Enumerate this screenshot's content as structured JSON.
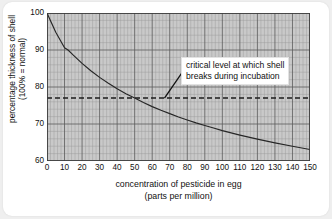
{
  "chart_data": {
    "type": "line",
    "title": "",
    "xlabel": "concentration of pesticide in egg",
    "xlabel_sub": "(parts per million)",
    "ylabel": "percentage thickness of shell",
    "ylabel_sub": "(100% = normal)",
    "xlim": [
      0,
      150
    ],
    "ylim": [
      60,
      100
    ],
    "xticks": [
      0,
      10,
      20,
      30,
      40,
      50,
      60,
      70,
      80,
      90,
      100,
      110,
      120,
      130,
      140,
      150
    ],
    "yticks": [
      60,
      70,
      80,
      90,
      100
    ],
    "grid": true,
    "grid_major_x": 10,
    "grid_minor_x": 2,
    "grid_major_y": 10,
    "grid_minor_y": 2,
    "legend": "none",
    "series": [
      {
        "name": "percentage thickness of shell",
        "x": [
          0,
          5,
          10,
          12,
          15,
          20,
          25,
          30,
          35,
          40,
          45,
          50,
          55,
          60,
          65,
          70,
          75,
          80,
          85,
          90,
          95,
          100,
          110,
          120,
          130,
          140,
          150
        ],
        "values": [
          100.0,
          94.8,
          90.6,
          90.0,
          88.6,
          86.4,
          84.4,
          82.6,
          81.0,
          79.5,
          78.2,
          77.0,
          75.8,
          74.7,
          73.7,
          72.8,
          71.9,
          71.1,
          70.3,
          69.6,
          68.9,
          68.2,
          67.0,
          65.9,
          64.9,
          64.0,
          63.1
        ]
      }
    ],
    "reference_lines": [
      {
        "name": "critical-level",
        "orientation": "horizontal",
        "value": 77,
        "style": "dashed"
      }
    ],
    "annotations": [
      {
        "name": "critical-level-annotation",
        "line1": "critical level at which shell",
        "line2": "breaks during incubation",
        "pointer_to_x": 67,
        "pointer_to_y": 77
      }
    ],
    "colors": {
      "plot_background": "#c9c9c9",
      "grid_major": "#5a5a5a",
      "grid_minor": "#9a9a9a",
      "curve": "#262626",
      "reference_line": "#1c1c1c",
      "page_background": "#efefef",
      "card_background": "#ffffff",
      "text": "#111111"
    }
  },
  "axis": {
    "y_title_line1": "percentage thickness of shell",
    "y_title_line2": "(100% = normal)",
    "x_title_line1": "concentration of pesticide in egg",
    "x_title_line2": "(parts per million)"
  }
}
